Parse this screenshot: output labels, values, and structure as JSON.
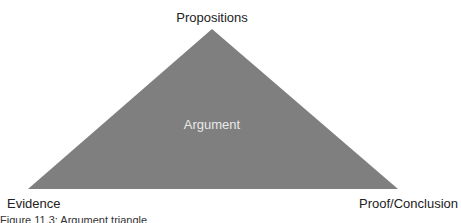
{
  "diagram": {
    "type": "triangle",
    "fill_color": "#7f7f7f",
    "apex_label": "Propositions",
    "left_label": "Evidence",
    "right_label": "Proof/Conclusion",
    "center_label": "Argument"
  },
  "caption": "Figure 11.3: Argument triangle"
}
